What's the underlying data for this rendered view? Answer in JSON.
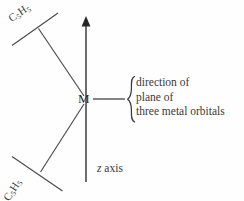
{
  "figure": {
    "type": "chemical-structure-diagram",
    "background_color": "#fefefe",
    "line_color": "#4a4a4a",
    "text_color": "#3a3a3a",
    "labels": {
      "cp_top": "C5H5",
      "cp_top_formula": {
        "element1": "C",
        "sub1": "5",
        "element2": "H",
        "sub2": "5"
      },
      "cp_bottom": "C5H5",
      "cp_bottom_formula": {
        "element1": "C",
        "sub1": "5",
        "element2": "H",
        "sub2": "5"
      },
      "metal": "M",
      "z_axis_italic": "z",
      "z_axis_word": "axis",
      "annotation_lines": [
        "direction of",
        "plane of",
        "three metal orbitals"
      ],
      "brace": "{"
    },
    "geometry": {
      "z_axis_x": 86,
      "z_axis_top": 17,
      "z_axis_bottom": 182,
      "metal_center": [
        86,
        99
      ],
      "cp_top_ring_line": [
        [
          12,
          45
        ],
        [
          58,
          13
        ]
      ],
      "cp_bottom_ring_line": [
        [
          12,
          157
        ],
        [
          62,
          191
        ]
      ],
      "bond_top": [
        [
          86,
          99
        ],
        [
          39,
          29
        ]
      ],
      "bond_bottom": [
        [
          86,
          99
        ],
        [
          41,
          172
        ]
      ],
      "orbital_plane_line": [
        [
          93,
          99
        ],
        [
          125,
          99
        ]
      ],
      "arrowhead_tip": [
        86,
        17
      ]
    }
  }
}
